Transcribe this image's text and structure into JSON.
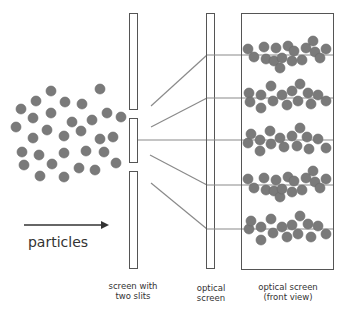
{
  "diagram": {
    "colors": {
      "particle": "#7a7a7a",
      "particle_stroke": "#6a6a6a",
      "outline": "#555555",
      "line": "#8a8a8a",
      "text": "#333333",
      "arrow": "#333333"
    },
    "labels": {
      "particles": "particles",
      "slit_screen_line1": "screen with",
      "slit_screen_line2": "two slits",
      "optical_screen_line1": "optical",
      "optical_screen_line2": "screen",
      "front_view_line1": "optical screen",
      "front_view_line2": "(front view)"
    },
    "source_particles": [
      [
        51,
        91
      ],
      [
        100,
        89
      ],
      [
        36,
        101
      ],
      [
        65,
        102
      ],
      [
        82,
        104
      ],
      [
        21,
        109
      ],
      [
        33,
        118
      ],
      [
        51,
        113
      ],
      [
        107,
        113
      ],
      [
        121,
        117
      ],
      [
        72,
        122
      ],
      [
        92,
        120
      ],
      [
        16,
        127
      ],
      [
        47,
        130
      ],
      [
        81,
        131
      ],
      [
        64,
        136
      ],
      [
        100,
        139
      ],
      [
        113,
        137
      ],
      [
        33,
        138
      ],
      [
        22,
        152
      ],
      [
        39,
        155
      ],
      [
        64,
        153
      ],
      [
        86,
        151
      ],
      [
        104,
        152
      ],
      [
        24,
        165
      ],
      [
        52,
        164
      ],
      [
        79,
        168
      ],
      [
        95,
        170
      ],
      [
        116,
        163
      ],
      [
        40,
        176
      ],
      [
        64,
        177
      ]
    ],
    "band_lines_y": [
      55,
      98,
      140,
      185,
      229
    ],
    "band_particles": [
      [
        [
          248,
          49
        ],
        [
          254,
          57
        ],
        [
          264,
          47
        ],
        [
          266,
          59
        ],
        [
          276,
          48
        ],
        [
          274,
          61
        ],
        [
          280,
          68
        ],
        [
          282,
          58
        ],
        [
          288,
          46
        ],
        [
          294,
          51
        ],
        [
          292,
          61
        ],
        [
          302,
          60
        ],
        [
          306,
          48
        ],
        [
          313,
          41
        ],
        [
          315,
          52
        ],
        [
          320,
          58
        ],
        [
          326,
          49
        ]
      ],
      [
        [
          249,
          93
        ],
        [
          250,
          102
        ],
        [
          261,
          95
        ],
        [
          261,
          108
        ],
        [
          271,
          86
        ],
        [
          273,
          101
        ],
        [
          282,
          95
        ],
        [
          287,
          105
        ],
        [
          292,
          91
        ],
        [
          298,
          101
        ],
        [
          300,
          84
        ],
        [
          308,
          93
        ],
        [
          311,
          104
        ],
        [
          318,
          95
        ],
        [
          326,
          101
        ]
      ],
      [
        [
          248,
          143
        ],
        [
          251,
          134
        ],
        [
          260,
          140
        ],
        [
          260,
          151
        ],
        [
          270,
          131
        ],
        [
          271,
          144
        ],
        [
          280,
          138
        ],
        [
          284,
          147
        ],
        [
          292,
          136
        ],
        [
          297,
          146
        ],
        [
          300,
          128
        ],
        [
          307,
          137
        ],
        [
          309,
          149
        ],
        [
          318,
          139
        ],
        [
          326,
          148
        ]
      ],
      [
        [
          248,
          179
        ],
        [
          254,
          188
        ],
        [
          264,
          178
        ],
        [
          266,
          190
        ],
        [
          276,
          180
        ],
        [
          274,
          191
        ],
        [
          280,
          197
        ],
        [
          282,
          189
        ],
        [
          288,
          177
        ],
        [
          294,
          181
        ],
        [
          292,
          192
        ],
        [
          302,
          190
        ],
        [
          306,
          178
        ],
        [
          313,
          171
        ],
        [
          315,
          182
        ],
        [
          320,
          188
        ],
        [
          326,
          179
        ]
      ],
      [
        [
          249,
          229
        ],
        [
          251,
          221
        ],
        [
          261,
          227
        ],
        [
          261,
          240
        ],
        [
          271,
          219
        ],
        [
          273,
          233
        ],
        [
          282,
          227
        ],
        [
          287,
          237
        ],
        [
          292,
          225
        ],
        [
          298,
          234
        ],
        [
          300,
          216
        ],
        [
          308,
          224
        ],
        [
          311,
          237
        ],
        [
          318,
          226
        ],
        [
          326,
          234
        ]
      ]
    ]
  }
}
